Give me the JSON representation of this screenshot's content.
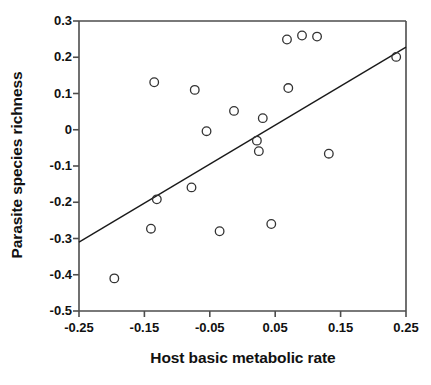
{
  "chart_data": {
    "type": "scatter",
    "title": "",
    "xlabel": "Host basic metabolic rate",
    "ylabel": "Parasite species richness",
    "xlim": [
      -0.25,
      0.25
    ],
    "ylim": [
      -0.5,
      0.3
    ],
    "xticks": [
      -0.25,
      -0.15,
      -0.05,
      0.05,
      0.15,
      0.25
    ],
    "xtick_labels": [
      "-0.25",
      "-0.15",
      "-0.05",
      "0.05",
      "0.15",
      "0.25"
    ],
    "yticks": [
      0.3,
      0.2,
      0.1,
      0,
      -0.1,
      -0.2,
      -0.3,
      -0.4,
      -0.5
    ],
    "ytick_labels": [
      "0.3",
      "0.2",
      "0.1",
      "0",
      "-0.1",
      "-0.2",
      "-0.3",
      "-0.4",
      "-0.5"
    ],
    "grid": false,
    "legend": null,
    "marker": "open-circle",
    "marker_color": "#333333",
    "marker_size": 6,
    "points": [
      {
        "x": -0.196,
        "y": -0.41
      },
      {
        "x": -0.14,
        "y": -0.273
      },
      {
        "x": -0.135,
        "y": 0.131
      },
      {
        "x": -0.131,
        "y": -0.192
      },
      {
        "x": -0.078,
        "y": -0.159
      },
      {
        "x": -0.073,
        "y": 0.11
      },
      {
        "x": -0.055,
        "y": -0.004
      },
      {
        "x": -0.035,
        "y": -0.28
      },
      {
        "x": -0.013,
        "y": 0.052
      },
      {
        "x": 0.022,
        "y": -0.03
      },
      {
        "x": 0.025,
        "y": -0.059
      },
      {
        "x": 0.031,
        "y": 0.032
      },
      {
        "x": 0.044,
        "y": -0.26
      },
      {
        "x": 0.068,
        "y": 0.249
      },
      {
        "x": 0.07,
        "y": 0.115
      },
      {
        "x": 0.091,
        "y": 0.26
      },
      {
        "x": 0.114,
        "y": 0.257
      },
      {
        "x": 0.132,
        "y": -0.066
      },
      {
        "x": 0.235,
        "y": 0.201
      }
    ],
    "regression_line": {
      "x_start": -0.25,
      "y_start": -0.31,
      "x_end": 0.25,
      "y_end": 0.228,
      "color": "#1a1a1a",
      "width": 1.4
    },
    "axis_color": "#4d4d4d",
    "background_color": "#ffffff"
  }
}
